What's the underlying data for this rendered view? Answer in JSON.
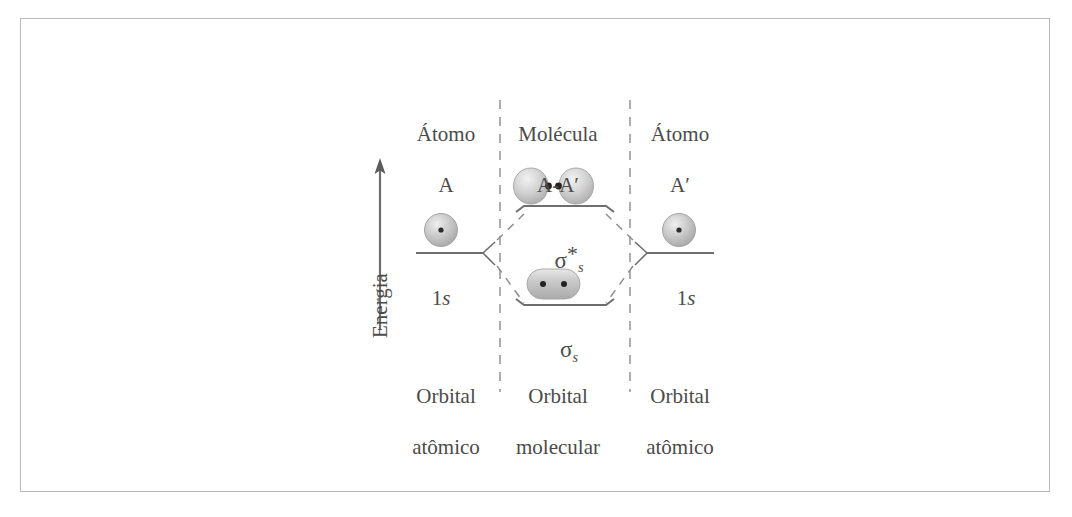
{
  "figure": {
    "type": "molecular-orbital-energy-diagram",
    "language": "pt-BR",
    "energy_axis": {
      "label": "Energia",
      "direction": "up",
      "arrow": "up-arrow-icon"
    },
    "columns": {
      "left": {
        "header_line1": "Átomo",
        "header_line2": "A",
        "footer_line1": "Orbital",
        "footer_line2": "atômico",
        "level_label": "1s",
        "orbital_icon": "sphere-1s-orbital-icon"
      },
      "middle": {
        "header_line1": "Molécula",
        "header_line2": "A-Aʹ",
        "footer_line1": "Orbital",
        "footer_line2": "molecular",
        "antibonding": {
          "label_base": "σ",
          "label_sub": "s",
          "label_sup": "*",
          "label_full": "σ*s",
          "orbital_icon": "antibonding-two-lobe-orbital-icon"
        },
        "bonding": {
          "label_base": "σ",
          "label_sub": "s",
          "label_sup": "",
          "label_full": "σs",
          "orbital_icon": "bonding-merged-orbital-icon"
        }
      },
      "right": {
        "header_line1": "Átomo",
        "header_line2": "Aʹ",
        "footer_line1": "Orbital",
        "footer_line2": "atômico",
        "level_label": "1s",
        "orbital_icon": "sphere-1s-orbital-icon"
      }
    },
    "colors": {
      "frame": "#b9b9b9",
      "line": "#6e6e6e",
      "dashed_divider": "#9a9a9a",
      "text": "#4b4b4b",
      "orbital_fill": "#c9c9c9",
      "nucleus": "#2b2b2b"
    }
  },
  "chart_data": {
    "type": "diagram",
    "ylabel": "Energia",
    "levels": [
      {
        "name": "1s",
        "column": "left",
        "relative_energy": 0.5
      },
      {
        "name": "1s",
        "column": "right",
        "relative_energy": 0.5
      },
      {
        "name": "σ*s",
        "column": "middle",
        "relative_energy": 1.0
      },
      {
        "name": "σs",
        "column": "middle",
        "relative_energy": 0.0
      }
    ]
  }
}
